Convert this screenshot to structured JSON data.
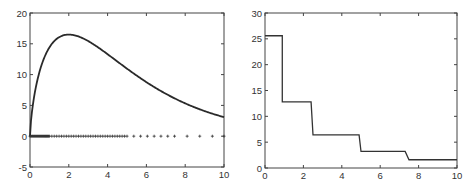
{
  "chart_data": [
    {
      "type": "line",
      "title": "",
      "xlabel": "",
      "ylabel": "",
      "xlim": [
        0,
        10
      ],
      "ylim": [
        -5,
        20
      ],
      "xticks": [
        0,
        2,
        4,
        6,
        8,
        10
      ],
      "yticks": [
        -5,
        0,
        5,
        10,
        15,
        20
      ],
      "grid": false,
      "series": [
        {
          "name": "curve",
          "style": "solid",
          "x": [
            0,
            0.25,
            0.5,
            1,
            1.5,
            2,
            2.5,
            3,
            4,
            5,
            6,
            7,
            8,
            9,
            10
          ],
          "values": [
            0,
            7.8,
            11.4,
            14.5,
            15.9,
            16.5,
            16.3,
            15.7,
            13.3,
            10.9,
            8.8,
            6.8,
            5.3,
            4.1,
            3.1
          ]
        },
        {
          "name": "sample points",
          "style": "plus-markers",
          "y_constant": 0,
          "x": [
            0,
            0.05,
            0.1,
            0.15,
            0.2,
            0.25,
            0.3,
            0.35,
            0.4,
            0.45,
            0.5,
            0.55,
            0.6,
            0.65,
            0.7,
            0.75,
            0.8,
            0.85,
            0.9,
            0.95,
            1.0,
            1.125,
            1.25,
            1.375,
            1.5,
            1.625,
            1.75,
            1.875,
            2.0,
            2.125,
            2.25,
            2.375,
            2.5,
            2.625,
            2.75,
            2.875,
            3.0,
            3.125,
            3.25,
            3.375,
            3.5,
            3.625,
            3.75,
            3.875,
            4.0,
            4.125,
            4.25,
            4.375,
            4.5,
            4.625,
            4.75,
            4.875,
            5.0,
            5.35,
            5.7,
            6.05,
            6.4,
            6.75,
            7.1,
            7.45,
            8.1,
            8.75,
            9.4,
            10.0
          ]
        }
      ]
    },
    {
      "type": "line",
      "title": "",
      "xlabel": "",
      "ylabel": "",
      "xlim": [
        0,
        10
      ],
      "ylim": [
        0,
        30
      ],
      "xticks": [
        0,
        2,
        4,
        6,
        8,
        10
      ],
      "yticks": [
        0,
        5,
        10,
        15,
        20,
        25,
        30
      ],
      "grid": false,
      "series": [
        {
          "name": "step",
          "style": "step",
          "x": [
            0,
            0.9,
            0.9,
            2.4,
            2.5,
            4.9,
            5.0,
            7.3,
            7.5,
            10
          ],
          "values": [
            25.6,
            25.6,
            12.8,
            12.8,
            6.4,
            6.4,
            3.2,
            3.2,
            1.6,
            1.6
          ]
        }
      ]
    }
  ]
}
